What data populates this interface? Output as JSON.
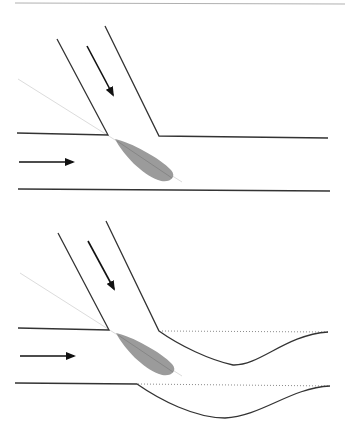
{
  "diagram": {
    "colors": {
      "wall": "#333333",
      "arrow": "#111111",
      "axis_line": "#d6d6d6",
      "separation_zone": "#9a9a9a",
      "separation_axis": "#7f7f7f",
      "original_wall_dotted": "#888888",
      "frame_line": "#b0b0b0"
    },
    "panels": [
      {
        "id": "top",
        "label": "unchanged channel",
        "elements": [
          "tributary-walls",
          "tributary-flow-arrow",
          "main-flow-arrow",
          "main-channel-walls",
          "separation-zone",
          "junction-angle-line"
        ]
      },
      {
        "id": "bottom",
        "label": "deformed channel",
        "elements": [
          "tributary-walls",
          "tributary-flow-arrow",
          "main-flow-arrow",
          "deformed-channel-walls",
          "original-wall-dotted-lines",
          "separation-zone",
          "junction-angle-line"
        ]
      }
    ]
  }
}
